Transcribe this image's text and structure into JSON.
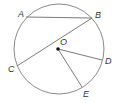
{
  "diagram": {
    "type": "circle-geometry",
    "circle": {
      "cx": 59,
      "cy": 49,
      "r": 45,
      "stroke": "#8a8a8a"
    },
    "center": {
      "name": "O",
      "x": 58,
      "y": 49,
      "label_x": 60,
      "label_y": 45
    },
    "points": [
      {
        "name": "A",
        "x": 26,
        "y": 17,
        "label_x": 18,
        "label_y": 17
      },
      {
        "name": "B",
        "x": 92,
        "y": 18,
        "label_x": 95,
        "label_y": 18
      },
      {
        "name": "C",
        "x": 17,
        "y": 66,
        "label_x": 8,
        "label_y": 72
      },
      {
        "name": "D",
        "x": 102,
        "y": 60,
        "label_x": 105,
        "label_y": 64
      },
      {
        "name": "E",
        "x": 82,
        "y": 87,
        "label_x": 83,
        "label_y": 97
      }
    ],
    "segments": [
      {
        "from": "A",
        "to": "B",
        "kind": "chord"
      },
      {
        "from": "B",
        "to": "C",
        "kind": "chord"
      },
      {
        "from": "O",
        "to": "D",
        "kind": "radius"
      },
      {
        "from": "O",
        "to": "E",
        "kind": "radius"
      }
    ],
    "line_color": "#7a7a7a"
  }
}
